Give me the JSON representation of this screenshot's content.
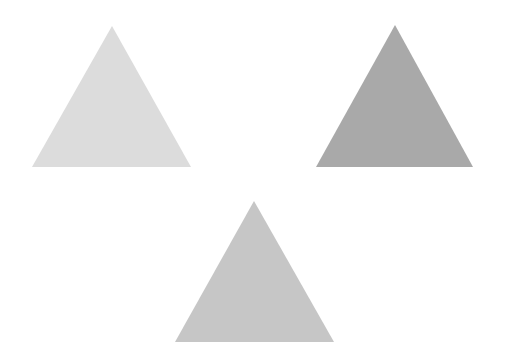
{
  "canvas": {
    "width": 506,
    "height": 364,
    "background": "#ffffff"
  },
  "shapes": [
    {
      "name": "triangle-light",
      "points": "112,26 32,167 191,167",
      "fill": "#dcdcdc"
    },
    {
      "name": "triangle-dark",
      "points": "395,25 316,167 473,167",
      "fill": "#a9a9a9"
    },
    {
      "name": "triangle-medium",
      "points": "254,201 175,342 334,342",
      "fill": "#c6c6c6"
    }
  ]
}
